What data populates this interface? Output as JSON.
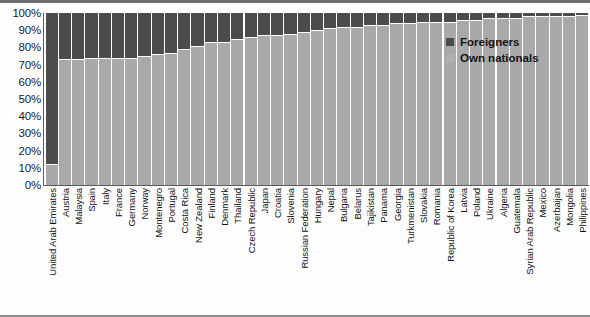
{
  "chart_data": {
    "type": "bar",
    "subtype": "stacked-100-percent",
    "title": "",
    "xlabel": "",
    "ylabel": "",
    "ylim": [
      0,
      100
    ],
    "ytick_labels": [
      "100%",
      "90%",
      "80%",
      "70%",
      "60%",
      "50%",
      "40%",
      "30%",
      "20%",
      "10%",
      "0%"
    ],
    "ytick_values": [
      100,
      90,
      80,
      70,
      60,
      50,
      40,
      30,
      20,
      10,
      0
    ],
    "grid": false,
    "legend_position": "top-right",
    "legend": [
      "Foreigners",
      "Own nationals"
    ],
    "colors": {
      "foreigners": "#4c4c4c",
      "own_nationals": "#a9a9a9",
      "axis": "#5c5c5c",
      "text": "#121212"
    },
    "categories": [
      "United Arab Emirates",
      "Austria",
      "Malaysia",
      "Spain",
      "Italy",
      "France",
      "Germany",
      "Norway",
      "Montenegro",
      "Portugal",
      "Costa Rica",
      "New Zealand",
      "Finland",
      "Denmark",
      "Thailand",
      "Czech Republic",
      "Japan",
      "Croatia",
      "Slovenia",
      "Russian Federation",
      "Hungary",
      "Nepal",
      "Bulgaria",
      "Belarus",
      "Tajikistan",
      "Panama",
      "Georgia",
      "Turkmenistan",
      "Slovakia",
      "Romania",
      "Republic of Korea",
      "Latvia",
      "Poland",
      "Ukraine",
      "Algeria",
      "Guatemala",
      "Syrian Arab Republic",
      "Mexico",
      "Azerbaijan",
      "Mongolia",
      "Philippines"
    ],
    "series": [
      {
        "name": "Foreigners",
        "values": [
          88,
          27,
          27,
          26,
          26,
          26,
          26,
          25,
          24,
          23,
          21,
          19,
          17,
          17,
          15,
          14,
          13,
          13,
          12,
          11,
          10,
          9,
          8,
          8,
          7,
          7,
          6,
          6,
          5,
          5,
          5,
          4,
          4,
          3,
          3,
          3,
          2,
          2,
          2,
          2,
          1
        ]
      },
      {
        "name": "Own nationals",
        "values": [
          12,
          73,
          73,
          74,
          74,
          74,
          74,
          75,
          76,
          77,
          79,
          81,
          83,
          83,
          85,
          86,
          87,
          87,
          88,
          89,
          90,
          91,
          92,
          92,
          93,
          93,
          94,
          94,
          95,
          95,
          95,
          96,
          96,
          97,
          97,
          97,
          98,
          98,
          98,
          98,
          99
        ]
      }
    ]
  }
}
